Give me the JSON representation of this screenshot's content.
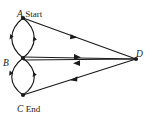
{
  "figure": {
    "stroke_color": "#1a1a1a",
    "background_color": "#ffffff",
    "width": 152,
    "height": 113
  },
  "nodes": [
    {
      "id": "A",
      "tag": "Start",
      "x": 23,
      "y": 18,
      "label_x": 17,
      "label_y": 4
    },
    {
      "id": "B",
      "tag": "",
      "x": 23,
      "y": 58,
      "label_x": 3,
      "label_y": 54
    },
    {
      "id": "C",
      "tag": "End",
      "x": 23,
      "y": 95,
      "label_x": 17,
      "label_y": 100
    },
    {
      "id": "D",
      "tag": "",
      "x": 136,
      "y": 59,
      "label_x": 136,
      "label_y": 44
    }
  ],
  "edges": [
    {
      "name": "edge-a-to-b-left",
      "from": "A",
      "to": "B",
      "shape": "curve",
      "side": "left",
      "direction": "down"
    },
    {
      "name": "edge-a-to-b-right",
      "from": "A",
      "to": "B",
      "shape": "curve",
      "side": "right",
      "direction": "down"
    },
    {
      "name": "edge-b-to-c-left",
      "from": "B",
      "to": "C",
      "shape": "curve",
      "side": "left",
      "direction": "down"
    },
    {
      "name": "edge-b-to-c-right",
      "from": "B",
      "to": "C",
      "shape": "curve",
      "side": "right",
      "direction": "down"
    },
    {
      "name": "edge-a-to-d",
      "from": "A",
      "to": "D",
      "shape": "line",
      "direction": "to-d"
    },
    {
      "name": "edge-b-to-d",
      "from": "B",
      "to": "D",
      "shape": "line",
      "direction": "to-d"
    },
    {
      "name": "edge-d-to-b",
      "from": "D",
      "to": "B",
      "shape": "line",
      "direction": "to-b"
    },
    {
      "name": "edge-d-to-c",
      "from": "D",
      "to": "C",
      "shape": "line",
      "direction": "to-c"
    }
  ]
}
